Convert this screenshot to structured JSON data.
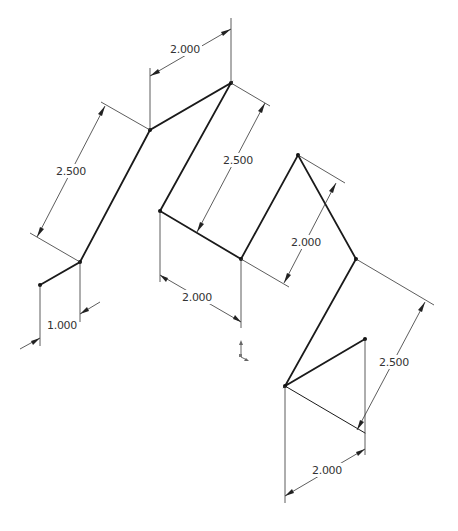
{
  "drawing": {
    "type": "isometric 3D sketch with dimensions",
    "background": "#ffffff",
    "line_color": "#1a1a1a",
    "dimension_color": "#333333"
  },
  "dimensions": [
    {
      "id": "dim-top-2000",
      "label": "2.000"
    },
    {
      "id": "dim-left-2500",
      "label": "2.500"
    },
    {
      "id": "dim-bottom-left-1000",
      "label": "1.000"
    },
    {
      "id": "dim-center-2500",
      "label": "2.500"
    },
    {
      "id": "dim-center-2000",
      "label": "2.000"
    },
    {
      "id": "dim-right-2000",
      "label": "2.000"
    },
    {
      "id": "dim-right-2500",
      "label": "2.500"
    },
    {
      "id": "dim-bottom-right-2000",
      "label": "2.000"
    }
  ],
  "origin_icon": "coordinate-axes-icon"
}
